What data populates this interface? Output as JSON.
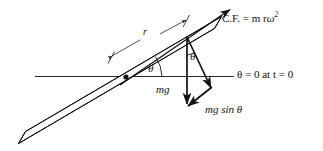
{
  "diagram": {
    "stroke_color": "#111111",
    "fill_color": "#ffffff",
    "labels": {
      "centrifugal_force": "C.F. = m r",
      "centrifugal_force_symbol": "ω",
      "centrifugal_force_exponent": "2",
      "centrifugal_force_full": "C.F. = m r ω²",
      "initial_condition": "θ = 0 at t = 0",
      "weight": "mg",
      "weight_component": "mg sin θ",
      "radius": "r",
      "angle_rod": "θ",
      "angle_triangle": "θ"
    },
    "elements": {
      "rod": "inclined-rod",
      "axis": "horizontal-reference-axis",
      "pivot": "pivot-point",
      "cf_arrow": "centrifugal-force-arrow",
      "mg_arrow": "weight-vector-arrow",
      "resultant_arrow": "resultant-vector-arrow",
      "mgsin_arrow": "weight-component-arrow",
      "dimension_line": "radius-dimension-line"
    }
  }
}
